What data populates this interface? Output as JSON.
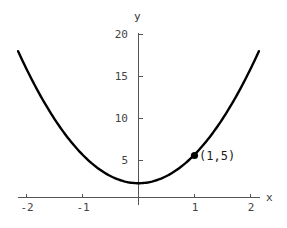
{
  "chart_data": {
    "type": "line",
    "title": "",
    "xlabel": "x",
    "ylabel": "y",
    "xlim": [
      -2.15,
      2.15
    ],
    "ylim": [
      0,
      20.5
    ],
    "grid": false,
    "legend": "none",
    "curve": {
      "name": "parabola",
      "equation": "y = 3.4x^2 + 1.7",
      "coefficients": {
        "a": 3.4,
        "b": 0,
        "c": 1.7
      },
      "color": "#000000",
      "linewidth": 2.4,
      "x": [
        -2.15,
        -2,
        -1.75,
        -1.5,
        -1.25,
        -1,
        -0.75,
        -0.5,
        -0.25,
        0,
        0.25,
        0.5,
        0.75,
        1,
        1.25,
        1.5,
        1.75,
        2,
        2.15
      ],
      "y": [
        17.4,
        15.3,
        12.1,
        9.35,
        7.01,
        5.1,
        3.61,
        2.55,
        1.91,
        1.7,
        1.91,
        2.55,
        3.61,
        5.1,
        7.01,
        9.35,
        12.1,
        15.3,
        17.4
      ]
    },
    "points": [
      {
        "x": 1,
        "y": 5,
        "label": "(1,5)",
        "marker": "filled-circle",
        "color": "#000000"
      }
    ],
    "xticks": [
      {
        "value": -2,
        "label": "-2"
      },
      {
        "value": -1,
        "label": "-1"
      },
      {
        "value": 1,
        "label": "1"
      },
      {
        "value": 2,
        "label": "2"
      }
    ],
    "yticks": [
      {
        "value": 5,
        "label": "5"
      },
      {
        "value": 10,
        "label": "10"
      },
      {
        "value": 15,
        "label": "15"
      },
      {
        "value": 20,
        "label": "20"
      }
    ],
    "axis_color": "#555555",
    "tick_label_color": "#444444"
  },
  "labels": {
    "y_axis_name": "y",
    "x_axis_name": "x",
    "point_annotation": "(1,5)",
    "ytick_5": "5",
    "ytick_10": "10",
    "ytick_15": "15",
    "ytick_20": "20",
    "xtick_neg2": "-2",
    "xtick_neg1": "-1",
    "xtick_1": "1",
    "xtick_2": "2"
  }
}
